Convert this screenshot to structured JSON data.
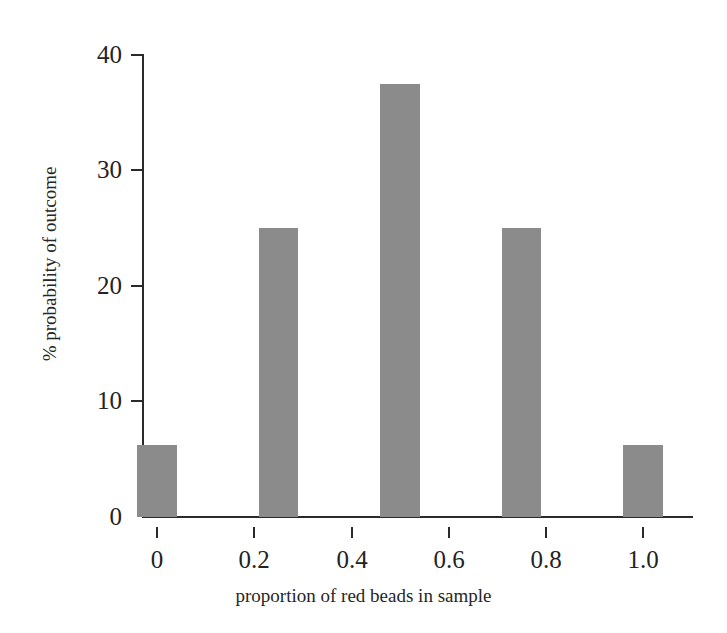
{
  "chart_data": {
    "type": "bar",
    "title": "",
    "subtitle": "",
    "xlabel": "proportion of red beads in sample",
    "ylabel": "% probability of outcome",
    "categories": [
      "0",
      "0.25",
      "0.5",
      "0.75",
      "1.0"
    ],
    "x": [
      0,
      0.25,
      0.5,
      0.75,
      1.0
    ],
    "values": [
      6.25,
      25,
      37.5,
      25,
      6.25
    ],
    "bar_width_data_units": 0.082,
    "xlim": [
      -0.06,
      1.06
    ],
    "ylim": [
      0,
      40
    ],
    "xticks": [
      0,
      0.2,
      0.4,
      0.6,
      0.8,
      1.0
    ],
    "xtick_labels": [
      "0",
      "0.2",
      "0.4",
      "0.6",
      "0.8",
      "1.0"
    ],
    "yticks": [
      0,
      10,
      20,
      30,
      40
    ],
    "ytick_labels": [
      "0",
      "10",
      "20",
      "30",
      "40"
    ],
    "grid": false,
    "legend": false,
    "legend_position": "none",
    "bar_color": "#8b8b8b",
    "axis_color": "#2a2a2a",
    "text_color": "#232323",
    "background": "#ffffff"
  },
  "axes": {
    "x_title": "proportion of red beads in sample",
    "y_title": "% probability of outcome"
  },
  "ticks": {
    "y": [
      {
        "label": "40"
      },
      {
        "label": "30"
      },
      {
        "label": "20"
      },
      {
        "label": "10"
      },
      {
        "label": "0"
      }
    ],
    "x": [
      {
        "label": "0"
      },
      {
        "label": "0.2"
      },
      {
        "label": "0.4"
      },
      {
        "label": "0.6"
      },
      {
        "label": "0.8"
      },
      {
        "label": "1.0"
      }
    ]
  }
}
